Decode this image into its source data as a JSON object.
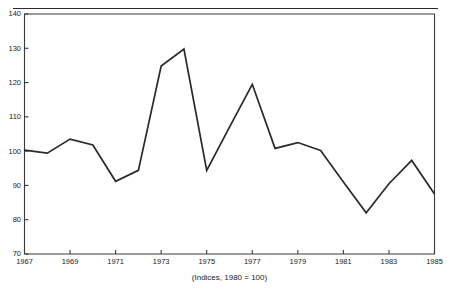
{
  "figure": {
    "clipped_header": "",
    "caption": "(Indices, 1980 = 100)"
  },
  "chart_data": {
    "type": "line",
    "title": "",
    "subtitle": "",
    "xlabel": "",
    "ylabel": "",
    "caption": "(Indices, 1980 = 100)",
    "grid": false,
    "legend": "none",
    "xlim": [
      1967,
      1985
    ],
    "ylim": [
      70,
      140
    ],
    "ytick_step": 10,
    "xtick_step": 2,
    "yticks": [
      70,
      80,
      90,
      100,
      110,
      120,
      130,
      140
    ],
    "ytick_labels": [
      "70",
      "80",
      "90",
      "100",
      "110",
      "120",
      "130",
      "140"
    ],
    "xticks": [
      1967,
      1969,
      1971,
      1973,
      1975,
      1977,
      1979,
      1981,
      1983,
      1985
    ],
    "xtick_labels": [
      "1967",
      "1969",
      "1971",
      "1973",
      "1975",
      "1977",
      "1979",
      "1981",
      "1983",
      "1985"
    ],
    "x": [
      1967,
      1968,
      1969,
      1970,
      1971,
      1972,
      1973,
      1974,
      1975,
      1976,
      1977,
      1978,
      1979,
      1980,
      1981,
      1982,
      1983,
      1984,
      1985
    ],
    "values": [
      100.3,
      99.4,
      103.5,
      101.8,
      91.2,
      94.4,
      124.8,
      129.8,
      94.4,
      107.0,
      119.5,
      100.8,
      102.5,
      100.2,
      91.0,
      82.0,
      90.5,
      97.3,
      87.5
    ],
    "series": [
      {
        "name": "Index",
        "color": "#2a2a2a",
        "values": [
          100.3,
          99.4,
          103.5,
          101.8,
          91.2,
          94.4,
          124.8,
          129.8,
          94.4,
          107.0,
          119.5,
          100.8,
          102.5,
          100.2,
          91.0,
          82.0,
          90.5,
          97.3,
          87.5
        ]
      }
    ]
  },
  "colors": {
    "line": "#2a2a2a",
    "axis": "#3a3a3a",
    "text": "#1a1a1a",
    "background": "#ffffff"
  }
}
